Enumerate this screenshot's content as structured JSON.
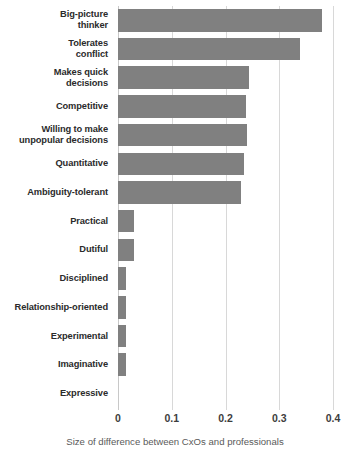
{
  "chart_data": {
    "type": "bar",
    "orientation": "horizontal",
    "title": "",
    "subtitle": "",
    "xlabel": "Size of difference between CxOs and professionals",
    "ylabel": "",
    "xlim": [
      0,
      0.4
    ],
    "xticks": [
      0,
      0.1,
      0.2,
      0.3,
      0.4
    ],
    "xtick_labels": [
      "0",
      "0.1",
      "0.2",
      "0.3",
      "0.4"
    ],
    "grid": "vertical",
    "legend": "none",
    "bar_color": "#808080",
    "categories": [
      "Big-picture thinker",
      "Tolerates conflict",
      "Makes quick decisions",
      "Competitive",
      "Willing to make unpopular decisions",
      "Quantitative",
      "Ambiguity-tolerant",
      "Practical",
      "Dutiful",
      "Disciplined",
      "Relationship-oriented",
      "Experimental",
      "Imaginative",
      "Expressive"
    ],
    "category_labels_wrapped": [
      "Big-picture\nthinker",
      "Tolerates\nconflict",
      "Makes quick\ndecisions",
      "Competitive",
      "Willing to make\nunpopular decisions",
      "Quantitative",
      "Ambiguity-tolerant",
      "Practical",
      "Dutiful",
      "Disciplined",
      "Relationship-oriented",
      "Experimental",
      "Imaginative",
      "Expressive"
    ],
    "values": [
      0.379,
      0.339,
      0.244,
      0.238,
      0.24,
      0.234,
      0.229,
      0.03,
      0.03,
      0.015,
      0.015,
      0.015,
      0.015,
      0.0
    ]
  },
  "caption": {
    "text": "Size of difference between CxOs and professionals"
  }
}
